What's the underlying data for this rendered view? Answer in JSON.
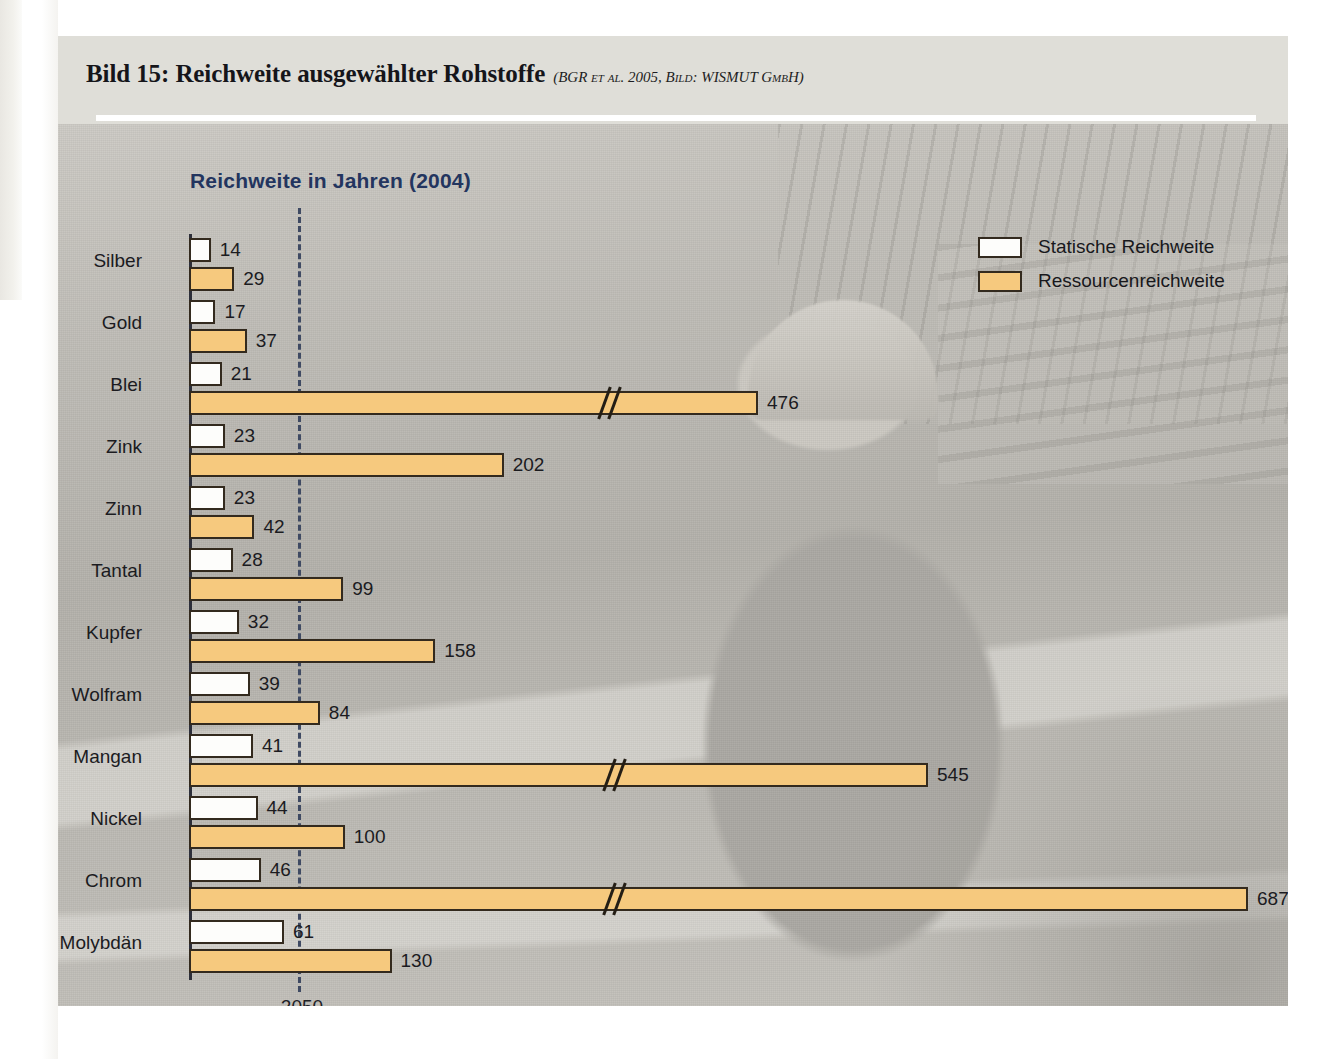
{
  "page_edge": {
    "vertical_text": "wissen zum"
  },
  "figure": {
    "title": "Bild 15: Reichweite ausgewählter Rohstoffe",
    "source": "(BGR et al. 2005, Bild: WISMUT GmbH)"
  },
  "legend": {
    "position": "top-right",
    "items": [
      {
        "label": "Statische Reichweite",
        "swatch": "white-square-icon",
        "color": "#fdfdfb"
      },
      {
        "label": "Ressourcenreichweite",
        "swatch": "orange-square-icon",
        "color": "#f6c97e"
      }
    ]
  },
  "axis": {
    "reference_line_label": "2050",
    "reference_line_color": "#3f4a63"
  },
  "colors": {
    "static_bar": "#fdfdfb",
    "resource_bar": "#f6c97e",
    "bar_border": "#332a1e",
    "subtitle": "#23355f",
    "figure_background": "#dfded8"
  },
  "chart_data": {
    "type": "bar",
    "orientation": "horizontal",
    "title": "Reichweite in Jahren (2004)",
    "subtitle": "Reichweite in Jahren (2004)",
    "xlabel": "",
    "ylabel": "",
    "xlim": [
      0,
      700
    ],
    "grid": false,
    "legend_position": "top-right",
    "annotations": [
      {
        "type": "reference-line",
        "label": "2050",
        "style": "dashed",
        "value": 46
      },
      {
        "type": "axis-break",
        "applies_to": [
          "Blei",
          "Mangan",
          "Chrom"
        ],
        "note": "Bars with axis break symbol"
      }
    ],
    "categories": [
      "Silber",
      "Gold",
      "Blei",
      "Zink",
      "Zinn",
      "Tantal",
      "Kupfer",
      "Wolfram",
      "Mangan",
      "Nickel",
      "Chrom",
      "Molybdän"
    ],
    "series": [
      {
        "name": "Statische Reichweite",
        "color": "#fdfdfb",
        "values": [
          14,
          17,
          21,
          23,
          23,
          28,
          32,
          39,
          41,
          44,
          46,
          61
        ]
      },
      {
        "name": "Ressourcenreichweite",
        "color": "#f6c97e",
        "values": [
          29,
          37,
          476,
          202,
          42,
          99,
          158,
          84,
          545,
          100,
          687,
          130
        ]
      }
    ],
    "rows": [
      {
        "category": "Silber",
        "static": 14,
        "resource": 29,
        "static_break": false,
        "resource_break": false
      },
      {
        "category": "Gold",
        "static": 17,
        "resource": 37,
        "static_break": false,
        "resource_break": false
      },
      {
        "category": "Blei",
        "static": 21,
        "resource": 476,
        "static_break": false,
        "resource_break": true
      },
      {
        "category": "Zink",
        "static": 23,
        "resource": 202,
        "static_break": false,
        "resource_break": false
      },
      {
        "category": "Zinn",
        "static": 23,
        "resource": 42,
        "static_break": false,
        "resource_break": false
      },
      {
        "category": "Tantal",
        "static": 28,
        "resource": 99,
        "static_break": false,
        "resource_break": false
      },
      {
        "category": "Kupfer",
        "static": 32,
        "resource": 158,
        "static_break": false,
        "resource_break": false
      },
      {
        "category": "Wolfram",
        "static": 39,
        "resource": 84,
        "static_break": false,
        "resource_break": false
      },
      {
        "category": "Mangan",
        "static": 41,
        "resource": 545,
        "static_break": false,
        "resource_break": true
      },
      {
        "category": "Nickel",
        "static": 44,
        "resource": 100,
        "static_break": false,
        "resource_break": false
      },
      {
        "category": "Chrom",
        "static": 46,
        "resource": 687,
        "static_break": false,
        "resource_break": true
      },
      {
        "category": "Molybdän",
        "static": 61,
        "resource": 130,
        "static_break": false,
        "resource_break": false
      }
    ]
  },
  "layout": {
    "axis_x_px": 131,
    "px_per_unit": 1.558,
    "row_top_px": 112,
    "row_step_px": 62,
    "break_positions_px": {
      "Blei": 540,
      "Mangan": 545,
      "Chrom": 545
    }
  }
}
